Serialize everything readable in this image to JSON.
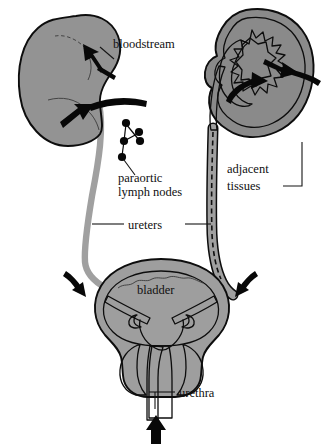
{
  "figure": {
    "background_color": "#ffffff"
  },
  "palette": {
    "outline": "#0d0d0d",
    "kidney_gray": "#939393",
    "cortex_gray": "#9a9a9a",
    "capsule_gray": "#8a8a8a",
    "pelvis_light": "#d8d8d8",
    "interior_light": "#e4e4e4",
    "ureter_gray": "#a0a0a0",
    "bladder_wall": "#9e9e9e",
    "bladder_lumen": "#ededed",
    "prostate_gray": "#8f8f8f",
    "arrow_black": "#080808",
    "text_black": "#101010"
  },
  "labels": {
    "bloodstream": "bloodstream",
    "paraortic_line1": "paraortic",
    "paraortic_line2": "lymph nodes",
    "adjacent_line1": "adjacent",
    "adjacent_line2": "tissues",
    "ureters": "ureters",
    "bladder": "bladder",
    "urethra": "urethra"
  },
  "structures": {
    "left_kidney": "left kidney, solid gray bean shape, external view",
    "right_kidney": "right kidney, cross-section showing cortex and calyces",
    "left_ureter": "left ureter, plain gray tube",
    "right_ureter": "right ureter, gray tube with dashed lumen",
    "bladder": "urinary bladder with trigone and ureteral orifices",
    "prostate": "prostate / bladder neck region",
    "urethra": "urethra, vertical light channel",
    "lymph_nodes": "paraortic lymph node chain, five dots"
  },
  "arrows": {
    "bloodstream_upper": "arrow into upper pole of left kidney",
    "bloodstream_lower": "arrow into hilum of left kidney",
    "adjacent_tissues": "arrow into right kidney calyces",
    "spread_into_pelvis": "curved arrow up into renal pelvis",
    "bladder_left": "arrow pointing down-right into bladder",
    "bladder_right": "arrow pointing down-left into bladder",
    "urethra_up": "arrow pointing up into urethra"
  }
}
